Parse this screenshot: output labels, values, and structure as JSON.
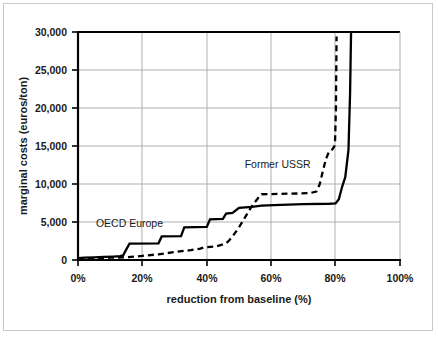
{
  "chart_data": {
    "type": "line",
    "title": "",
    "xlabel": "reduction from baseline (%)",
    "ylabel": "marginal costs (euros/ton)",
    "xlim": [
      0,
      100
    ],
    "ylim": [
      0,
      30000
    ],
    "xticks": [
      "0%",
      "20%",
      "40%",
      "60%",
      "80%",
      "100%"
    ],
    "xtick_values": [
      0,
      20,
      40,
      60,
      80,
      100
    ],
    "yticks": [
      "0",
      "5,000",
      "10,000",
      "15,000",
      "20,000",
      "25,000",
      "30,000"
    ],
    "ytick_values": [
      0,
      5000,
      10000,
      15000,
      20000,
      25000,
      30000
    ],
    "grid": "horizontal-and-vertical",
    "legend_position": "inline-annotations",
    "series": [
      {
        "name": "OECD Europe",
        "style": "solid",
        "label_x": 16,
        "label_y": 4350,
        "points": [
          [
            0,
            250
          ],
          [
            2,
            300
          ],
          [
            5,
            350
          ],
          [
            8,
            400
          ],
          [
            11,
            450
          ],
          [
            13,
            500
          ],
          [
            14,
            600
          ],
          [
            15,
            1400
          ],
          [
            16,
            2150
          ],
          [
            25,
            2200
          ],
          [
            26,
            3100
          ],
          [
            32,
            3150
          ],
          [
            33,
            4300
          ],
          [
            40,
            4350
          ],
          [
            41,
            5350
          ],
          [
            45,
            5400
          ],
          [
            46,
            6100
          ],
          [
            48,
            6200
          ],
          [
            50,
            6850
          ],
          [
            54,
            7000
          ],
          [
            57,
            7150
          ],
          [
            63,
            7250
          ],
          [
            70,
            7350
          ],
          [
            78,
            7400
          ],
          [
            80,
            7450
          ],
          [
            81,
            8000
          ],
          [
            82,
            9600
          ],
          [
            83,
            10900
          ],
          [
            84,
            14500
          ],
          [
            84.5,
            22000
          ],
          [
            84.8,
            30000
          ]
        ]
      },
      {
        "name": "Former USSR",
        "style": "dashed",
        "label_x": 62,
        "label_y": 12100,
        "points": [
          [
            0,
            200
          ],
          [
            5,
            250
          ],
          [
            10,
            300
          ],
          [
            14,
            350
          ],
          [
            18,
            450
          ],
          [
            20,
            550
          ],
          [
            25,
            750
          ],
          [
            30,
            1050
          ],
          [
            35,
            1300
          ],
          [
            38,
            1500
          ],
          [
            39,
            1650
          ],
          [
            43,
            1800
          ],
          [
            46,
            2200
          ],
          [
            47,
            2600
          ],
          [
            48,
            3100
          ],
          [
            50,
            4300
          ],
          [
            52,
            5700
          ],
          [
            54,
            7100
          ],
          [
            56,
            8200
          ],
          [
            57,
            8650
          ],
          [
            62,
            8700
          ],
          [
            68,
            8750
          ],
          [
            72,
            8800
          ],
          [
            74,
            9000
          ],
          [
            75,
            9900
          ],
          [
            76,
            11600
          ],
          [
            77,
            13300
          ],
          [
            78,
            14300
          ],
          [
            79,
            14550
          ],
          [
            79.8,
            15100
          ],
          [
            80.1,
            20000
          ],
          [
            80.3,
            29400
          ]
        ]
      }
    ],
    "annotations": [
      {
        "text": "OECD Europe",
        "x": 16,
        "y": 4350
      },
      {
        "text": "Former USSR",
        "x": 62,
        "y": 12100
      }
    ]
  }
}
